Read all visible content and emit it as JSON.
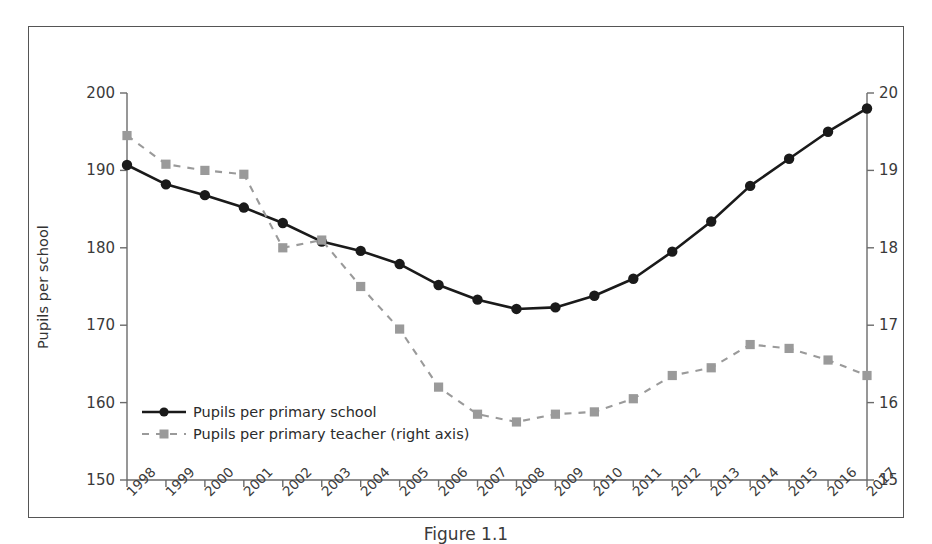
{
  "chart_data": {
    "type": "line",
    "title": "",
    "xlabel": "",
    "categories": [
      "1998",
      "1999",
      "2000",
      "2001",
      "2002",
      "2003",
      "2004",
      "2005",
      "2006",
      "2007",
      "2008",
      "2009",
      "2010",
      "2011",
      "2012",
      "2013",
      "2014",
      "2015",
      "2016",
      "2017"
    ],
    "grid": false,
    "legend_position": "lower-left",
    "axes": {
      "left": {
        "label": "Pupils per school",
        "ylim": [
          150,
          200
        ],
        "ticks": [
          150,
          160,
          170,
          180,
          190,
          200
        ],
        "tick_labels": [
          "150",
          "160",
          "170",
          "180",
          "190",
          "200"
        ]
      },
      "right": {
        "label": "Pupils per teacher",
        "ylim": [
          15,
          20
        ],
        "ticks": [
          15,
          16,
          17,
          18,
          19,
          20
        ],
        "tick_labels": [
          "15",
          "16",
          "17",
          "18",
          "19",
          "20"
        ]
      }
    },
    "series": [
      {
        "name": "Pupils per primary school",
        "axis": "left",
        "color": "#1a1a1a",
        "line_style": "solid",
        "marker": "circle",
        "values": [
          190.7,
          188.2,
          186.8,
          185.2,
          183.2,
          180.8,
          179.6,
          177.9,
          175.2,
          173.3,
          172.1,
          172.3,
          173.8,
          176.0,
          179.5,
          183.4,
          188.0,
          191.5,
          195.0,
          198.0
        ]
      },
      {
        "name": "Pupils per primary teacher (right axis)",
        "axis": "right",
        "color": "#9a9a9a",
        "line_style": "dashed",
        "marker": "square",
        "values": [
          19.45,
          19.08,
          19.0,
          18.95,
          18.0,
          18.1,
          17.5,
          16.95,
          16.2,
          15.85,
          15.75,
          15.85,
          15.88,
          16.05,
          16.35,
          16.45,
          16.75,
          16.7,
          16.55,
          16.35
        ]
      }
    ]
  },
  "legend": {
    "items": [
      {
        "label": "Pupils per primary school",
        "style": "solid-circle"
      },
      {
        "label": "Pupils per primary teacher (right axis)",
        "style": "dashed-square"
      }
    ]
  },
  "caption": "Figure 1.1",
  "colors": {
    "series_primary": "#1a1a1a",
    "series_secondary": "#9a9a9a",
    "axis": "#6b6b6b",
    "frame": "#555555",
    "background": "#ffffff"
  }
}
